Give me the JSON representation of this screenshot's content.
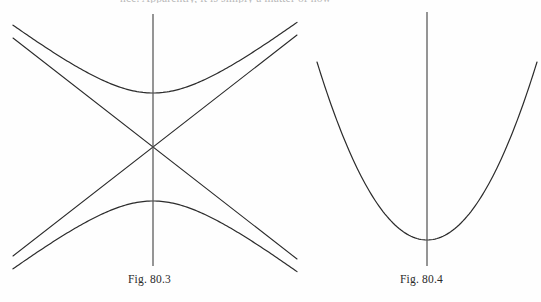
{
  "page": {
    "background_color": "#fefefe",
    "ink_color": "#2b2b2b",
    "width": 541,
    "height": 302,
    "partial_top_line": "nce. Apparently, it is simply a matter of how"
  },
  "figures": [
    {
      "id": "fig-80-3",
      "caption": "Fig. 80.3",
      "kind": "hyperbola-with-asymptotes",
      "description": "Vertical-transverse-axis hyperbola with its two straight asymptotes crossing at the centre, plus a vertical axis line",
      "center": {
        "x": 153,
        "y": 147
      },
      "vertex_offset": 54,
      "asymptote_slope": 0.78,
      "axis_line": {
        "x": 153,
        "y_top": 14,
        "y_bottom": 266
      },
      "stroke_width": 1.15
    },
    {
      "id": "fig-80-4",
      "caption": "Fig. 80.4",
      "kind": "parabola",
      "description": "Upward-opening parabola with a vertical axis of symmetry through the vertex",
      "vertex": {
        "x": 427,
        "y": 240
      },
      "left_end": {
        "x": 317,
        "y": 68
      },
      "right_end": {
        "x": 537,
        "y": 62
      },
      "axis_line": {
        "x": 427,
        "y_top": 12,
        "y_bottom": 266
      },
      "stroke_width": 1.15
    }
  ],
  "chart_data": {
    "type": "line",
    "title": "",
    "xlabel": "",
    "ylabel": "",
    "grid": false,
    "legend": "none",
    "panels": [
      {
        "name": "Fig. 80.3",
        "curves": [
          {
            "name": "hyperbola-upper-branch",
            "equation": "y = cy - b*sqrt(1 + (x-cx)^2/a^2)",
            "vertex": [
              153,
              93
            ],
            "opens": "up",
            "x_range": [
              13,
              297
            ]
          },
          {
            "name": "hyperbola-lower-branch",
            "equation": "y = cy + b*sqrt(1 + (x-cx)^2/a^2)",
            "vertex": [
              153,
              200
            ],
            "opens": "down",
            "x_range": [
              13,
              297
            ]
          },
          {
            "name": "asymptote-positive-slope",
            "equation": "y = 147 - 0.78*(x-153)",
            "endpoints": [
              [
                13,
                256
              ],
              [
                297,
                35
              ]
            ]
          },
          {
            "name": "asymptote-negative-slope",
            "equation": "y = 147 + 0.78*(x-153)",
            "endpoints": [
              [
                13,
                38
              ],
              [
                297,
                259
              ]
            ]
          },
          {
            "name": "vertical-axis",
            "endpoints": [
              [
                153,
                14
              ],
              [
                153,
                266
              ]
            ]
          }
        ]
      },
      {
        "name": "Fig. 80.4",
        "curves": [
          {
            "name": "parabola",
            "equation": "y = 240 + 0.0142*(x-427)^2",
            "vertex": [
              427,
              240
            ],
            "opens": "up",
            "x_range": [
              317,
              537
            ]
          },
          {
            "name": "vertical-axis",
            "endpoints": [
              [
                427,
                12
              ],
              [
                427,
                266
              ]
            ]
          }
        ]
      }
    ]
  }
}
